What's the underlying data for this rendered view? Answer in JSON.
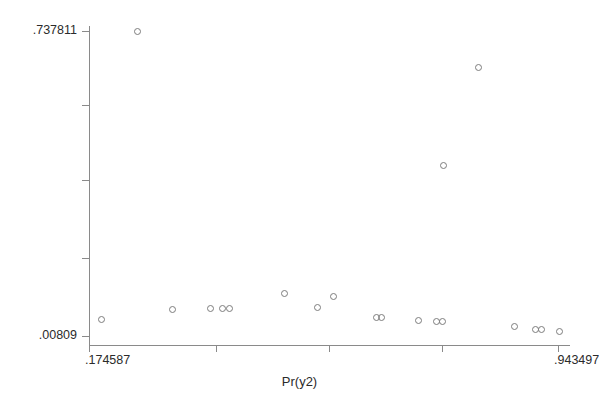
{
  "chart_data": {
    "type": "scatter",
    "title": "",
    "xlabel": "Pr(y2)",
    "ylabel": "",
    "grid": false,
    "legend": null,
    "xlim": [
      0.174587,
      0.943497
    ],
    "ylim": [
      0.00809,
      0.737811
    ],
    "xticklabels": [
      ".174587",
      "",
      "",
      "",
      ".943497"
    ],
    "yticklabels": [
      ".737811",
      "",
      "",
      "",
      ".00809"
    ],
    "xtick_values": [
      0.174587,
      0.382756,
      0.567989,
      0.753222,
      0.943497
    ],
    "ytick_values": [
      0.737811,
      0.5607,
      0.3812,
      0.1945,
      0.00809
    ],
    "marker": "open-circle",
    "marker_color": "#7d7d7d",
    "points": [
      {
        "x": 0.2533,
        "y": 0.7378
      },
      {
        "x": 0.1956,
        "y": 0.0464
      },
      {
        "x": 0.3113,
        "y": 0.0703
      },
      {
        "x": 0.3736,
        "y": 0.0727
      },
      {
        "x": 0.3933,
        "y": 0.0727
      },
      {
        "x": 0.4047,
        "y": 0.0727
      },
      {
        "x": 0.4949,
        "y": 0.1086
      },
      {
        "x": 0.549,
        "y": 0.0751
      },
      {
        "x": 0.5752,
        "y": 0.1014
      },
      {
        "x": 0.6457,
        "y": 0.0512
      },
      {
        "x": 0.6539,
        "y": 0.0512
      },
      {
        "x": 0.7145,
        "y": 0.044
      },
      {
        "x": 0.744,
        "y": 0.0416
      },
      {
        "x": 0.7538,
        "y": 0.0416
      },
      {
        "x": 0.7555,
        "y": 0.4172
      },
      {
        "x": 0.8129,
        "y": 0.6514
      },
      {
        "x": 0.8719,
        "y": 0.0297
      },
      {
        "x": 0.9063,
        "y": 0.0225
      },
      {
        "x": 0.9161,
        "y": 0.0225
      },
      {
        "x": 0.9456,
        "y": 0.0177
      }
    ]
  }
}
